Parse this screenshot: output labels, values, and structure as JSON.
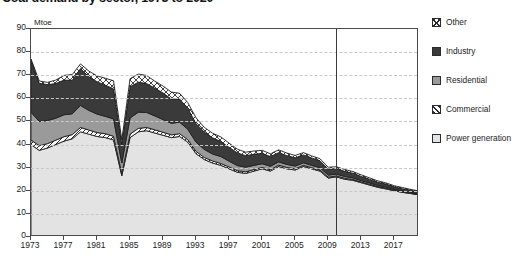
{
  "title": "Coal demand by sector, 1973 to 2020",
  "unit_label": "Mtoe",
  "legend": {
    "items": [
      {
        "label": "Other",
        "key": "other",
        "pattern": "cross-hatch",
        "color": "#ffffff"
      },
      {
        "label": "Industry",
        "key": "industry",
        "pattern": "solid",
        "color": "#3a3a3a"
      },
      {
        "label": "Residential",
        "key": "residential",
        "pattern": "solid",
        "color": "#9a9a9a"
      },
      {
        "label": "Commercial",
        "key": "commercial",
        "pattern": "diagonal-hatch",
        "color": "#ffffff"
      },
      {
        "label": "Power generation",
        "key": "power",
        "pattern": "solid",
        "color": "#e3e3e3"
      }
    ]
  },
  "divider": {
    "year": 2010,
    "note": "projection-divider"
  },
  "chart_data": {
    "type": "area",
    "stacked": true,
    "title": "Coal demand by sector, 1973 to 2020",
    "xlabel": "",
    "ylabel": "Mtoe",
    "ylim": [
      0,
      90
    ],
    "ytick_step": 10,
    "yticks": [
      0,
      10,
      20,
      30,
      40,
      50,
      60,
      70,
      80,
      90
    ],
    "xlim": [
      1973,
      2020
    ],
    "xticks": [
      1973,
      1977,
      1981,
      1985,
      1989,
      1993,
      1997,
      2001,
      2005,
      2009,
      2013,
      2017
    ],
    "grid": "horizontal-dashed",
    "legend_position": "right",
    "x": [
      1973,
      1974,
      1975,
      1976,
      1977,
      1978,
      1979,
      1980,
      1981,
      1982,
      1983,
      1984,
      1985,
      1986,
      1987,
      1988,
      1989,
      1990,
      1991,
      1992,
      1993,
      1994,
      1995,
      1996,
      1997,
      1998,
      1999,
      2000,
      2001,
      2002,
      2003,
      2004,
      2005,
      2006,
      2007,
      2008,
      2009,
      2010,
      2011,
      2012,
      2013,
      2014,
      2015,
      2016,
      2017,
      2018,
      2019,
      2020
    ],
    "series": [
      {
        "name": "Power generation",
        "order": 1,
        "values": [
          40.0,
          37.5,
          38.5,
          40.0,
          41.5,
          42.5,
          45.5,
          44.5,
          43.5,
          43.0,
          42.0,
          26.5,
          43.0,
          45.5,
          46.0,
          45.0,
          44.0,
          43.0,
          43.5,
          41.0,
          36.0,
          33.5,
          32.0,
          31.0,
          29.5,
          28.0,
          27.5,
          28.5,
          29.5,
          28.5,
          30.5,
          29.5,
          29.0,
          30.5,
          29.5,
          28.5,
          25.5,
          26.0,
          25.0,
          24.5,
          23.5,
          22.5,
          21.5,
          20.8,
          20.0,
          19.3,
          18.8,
          18.2
        ]
      },
      {
        "name": "Commercial",
        "order": 2,
        "values": [
          2.0,
          2.0,
          1.9,
          1.9,
          1.9,
          1.8,
          1.9,
          1.8,
          1.7,
          1.7,
          1.6,
          1.0,
          1.5,
          1.5,
          1.4,
          1.4,
          1.3,
          1.2,
          1.2,
          1.1,
          1.0,
          0.9,
          0.9,
          0.8,
          0.8,
          0.7,
          0.7,
          0.7,
          0.6,
          0.6,
          0.6,
          0.6,
          0.5,
          0.5,
          0.5,
          0.5,
          0.4,
          0.4,
          0.4,
          0.4,
          0.3,
          0.3,
          0.3,
          0.3,
          0.2,
          0.2,
          0.2,
          0.2
        ]
      },
      {
        "name": "Residential",
        "order": 3,
        "values": [
          12.0,
          10.5,
          10.0,
          9.5,
          9.5,
          9.0,
          9.5,
          8.5,
          8.0,
          7.5,
          7.5,
          4.5,
          7.0,
          7.0,
          6.5,
          6.0,
          5.5,
          5.0,
          5.0,
          4.5,
          4.0,
          3.5,
          3.0,
          3.0,
          2.5,
          2.2,
          2.0,
          1.8,
          1.6,
          1.5,
          1.4,
          1.3,
          1.2,
          1.1,
          1.0,
          1.0,
          0.9,
          0.8,
          0.8,
          0.7,
          0.6,
          0.6,
          0.5,
          0.5,
          0.4,
          0.4,
          0.3,
          0.3
        ]
      },
      {
        "name": "Industry",
        "order": 4,
        "values": [
          22.5,
          16.5,
          15.5,
          15.0,
          15.0,
          14.5,
          16.0,
          14.5,
          14.0,
          13.5,
          13.0,
          8.0,
          13.5,
          13.0,
          12.5,
          12.0,
          11.5,
          10.5,
          10.0,
          9.0,
          8.0,
          7.5,
          7.0,
          6.5,
          6.0,
          5.5,
          5.0,
          4.8,
          4.5,
          4.2,
          4.0,
          3.8,
          3.6,
          3.4,
          3.2,
          3.0,
          2.6,
          2.4,
          2.2,
          2.0,
          1.8,
          1.6,
          1.4,
          1.3,
          1.1,
          1.0,
          0.9,
          0.8
        ]
      },
      {
        "name": "Other",
        "order": 5,
        "values": [
          0.5,
          1.0,
          1.0,
          1.5,
          2.0,
          2.5,
          2.0,
          2.5,
          2.5,
          3.0,
          3.5,
          2.0,
          3.5,
          3.5,
          3.5,
          3.0,
          3.0,
          3.0,
          2.5,
          2.5,
          2.5,
          2.0,
          2.0,
          2.0,
          1.8,
          1.6,
          1.5,
          1.4,
          1.3,
          1.2,
          1.2,
          1.1,
          1.0,
          1.0,
          0.9,
          0.9,
          0.8,
          0.8,
          0.8,
          0.7,
          0.7,
          0.6,
          0.6,
          0.5,
          0.5,
          0.5,
          0.4,
          0.4
        ]
      }
    ],
    "totals": [
      77.0,
      67.5,
      66.9,
      67.9,
      69.9,
      70.3,
      74.9,
      71.8,
      69.7,
      68.7,
      67.6,
      42.0,
      68.5,
      70.5,
      69.9,
      67.4,
      65.3,
      62.7,
      62.2,
      58.1,
      51.5,
      47.4,
      44.9,
      43.3,
      40.6,
      38.0,
      36.7,
      37.2,
      37.5,
      36.0,
      37.7,
      36.3,
      35.3,
      36.5,
      35.1,
      33.9,
      30.2,
      30.4,
      29.2,
      28.3,
      26.9,
      25.6,
      24.3,
      23.4,
      22.2,
      21.4,
      20.6,
      19.9
    ]
  }
}
